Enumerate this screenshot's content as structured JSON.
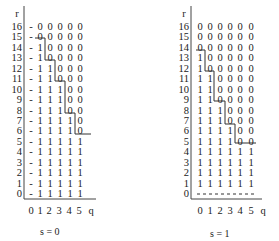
{
  "figure": {
    "panels": [
      {
        "id": "s0",
        "caption": "s = 0",
        "y_axis_label": "r",
        "x_axis_label": "q",
        "x_ticks": [
          "0",
          "1",
          "2",
          "3",
          "4",
          "5"
        ],
        "rows": [
          {
            "r": "16",
            "cells": [
              "-",
              "0",
              "0",
              "0",
              "0",
              "0"
            ]
          },
          {
            "r": "15",
            "cells": [
              "-",
              "0",
              "0",
              "0",
              "0",
              "0"
            ]
          },
          {
            "r": "14",
            "cells": [
              "-",
              "1",
              "0",
              "0",
              "0",
              "0"
            ]
          },
          {
            "r": "13",
            "cells": [
              "-",
              "1",
              "0",
              "0",
              "0",
              "0"
            ]
          },
          {
            "r": "12",
            "cells": [
              "-",
              "1",
              "1",
              "0",
              "0",
              "0"
            ]
          },
          {
            "r": "11",
            "cells": [
              "-",
              "1",
              "1",
              "0",
              "0",
              "0"
            ]
          },
          {
            "r": "10",
            "cells": [
              "-",
              "1",
              "1",
              "1",
              "0",
              "0"
            ]
          },
          {
            "r": "9",
            "cells": [
              "-",
              "1",
              "1",
              "1",
              "0",
              "0"
            ]
          },
          {
            "r": "8",
            "cells": [
              "-",
              "1",
              "1",
              "1",
              "0",
              "0"
            ]
          },
          {
            "r": "7",
            "cells": [
              "-",
              "1",
              "1",
              "1",
              "1",
              "0"
            ]
          },
          {
            "r": "6",
            "cells": [
              "-",
              "1",
              "1",
              "1",
              "1",
              "0"
            ]
          },
          {
            "r": "5",
            "cells": [
              "-",
              "1",
              "1",
              "1",
              "1",
              "1"
            ]
          },
          {
            "r": "4",
            "cells": [
              "-",
              "1",
              "1",
              "1",
              "1",
              "1"
            ]
          },
          {
            "r": "3",
            "cells": [
              "-",
              "1",
              "1",
              "1",
              "1",
              "1"
            ]
          },
          {
            "r": "2",
            "cells": [
              "-",
              "1",
              "1",
              "1",
              "1",
              "1"
            ]
          },
          {
            "r": "1",
            "cells": [
              "-",
              "1",
              "1",
              "1",
              "1",
              "1"
            ]
          },
          {
            "r": "0",
            "cells": [
              "-",
              "1",
              "1",
              "1",
              "1",
              "1"
            ]
          }
        ]
      },
      {
        "id": "s1",
        "caption": "s = 1",
        "y_axis_label": "r",
        "x_axis_label": "q",
        "x_ticks": [
          "0",
          "1",
          "2",
          "3",
          "4",
          "5"
        ],
        "rows": [
          {
            "r": "16",
            "cells": [
              "0",
              "0",
              "0",
              "0",
              "0",
              "0"
            ]
          },
          {
            "r": "15",
            "cells": [
              "0",
              "0",
              "0",
              "0",
              "0",
              "0"
            ]
          },
          {
            "r": "14",
            "cells": [
              "0",
              "0",
              "0",
              "0",
              "0",
              "0"
            ]
          },
          {
            "r": "13",
            "cells": [
              "1",
              "0",
              "0",
              "0",
              "0",
              "0"
            ]
          },
          {
            "r": "12",
            "cells": [
              "1",
              "0",
              "0",
              "0",
              "0",
              "0"
            ]
          },
          {
            "r": "11",
            "cells": [
              "1",
              "1",
              "0",
              "0",
              "0",
              "0"
            ]
          },
          {
            "r": "10",
            "cells": [
              "1",
              "1",
              "0",
              "0",
              "0",
              "0"
            ]
          },
          {
            "r": "9",
            "cells": [
              "1",
              "1",
              "0",
              "0",
              "0",
              "0"
            ]
          },
          {
            "r": "8",
            "cells": [
              "1",
              "1",
              "1",
              "0",
              "0",
              "0"
            ]
          },
          {
            "r": "7",
            "cells": [
              "1",
              "1",
              "1",
              "0",
              "0",
              "0"
            ]
          },
          {
            "r": "6",
            "cells": [
              "1",
              "1",
              "1",
              "1",
              "0",
              "0"
            ]
          },
          {
            "r": "5",
            "cells": [
              "1",
              "1",
              "1",
              "1",
              "0",
              "0"
            ]
          },
          {
            "r": "4",
            "cells": [
              "1",
              "1",
              "1",
              "1",
              "1",
              "1"
            ]
          },
          {
            "r": "3",
            "cells": [
              "1",
              "1",
              "1",
              "1",
              "1",
              "1"
            ]
          },
          {
            "r": "2",
            "cells": [
              "1",
              "1",
              "1",
              "1",
              "1",
              "1"
            ]
          },
          {
            "r": "1",
            "cells": [
              "1",
              "1",
              "1",
              "1",
              "1",
              "1"
            ]
          },
          {
            "r": "0",
            "cells": [
              "-",
              "-",
              "-",
              "-",
              "-",
              "-"
            ]
          }
        ],
        "row0_style": "dashed-line"
      }
    ]
  },
  "style": {
    "text_color": "#222222",
    "staircase_color": "#333333",
    "background": "#ffffff"
  }
}
